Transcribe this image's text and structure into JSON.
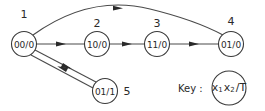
{
  "diagram": {
    "type": "state-transition-graph",
    "colors": {
      "stroke": "#3a3a3a",
      "text": "#2a2a2a",
      "background": "#ffffff"
    },
    "nodes": [
      {
        "id": "1",
        "number": "1",
        "label": "00/0"
      },
      {
        "id": "2",
        "number": "2",
        "label": "10/0"
      },
      {
        "id": "3",
        "number": "3",
        "label": "11/0"
      },
      {
        "id": "4",
        "number": "4",
        "label": "01/0"
      },
      {
        "id": "5",
        "number": "5",
        "label": "01/1"
      }
    ],
    "edges": [
      {
        "from": "1",
        "to": "2"
      },
      {
        "from": "2",
        "to": "3"
      },
      {
        "from": "3",
        "to": "4"
      },
      {
        "from": "1",
        "to": "4",
        "style": "arc"
      },
      {
        "from": "1",
        "to": "5"
      },
      {
        "from": "5",
        "to": "1"
      }
    ],
    "key": {
      "label": "Key :",
      "x1": "x",
      "x1_sub": "1",
      "x2": "x",
      "x2_sub": "2",
      "sep": "/",
      "t": "T"
    }
  }
}
